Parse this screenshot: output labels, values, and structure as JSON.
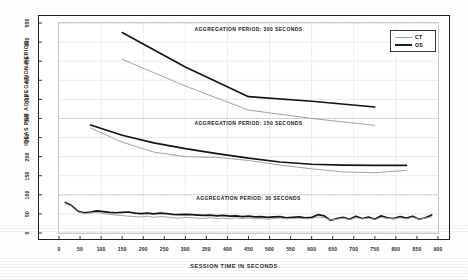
{
  "chart_data": {
    "type": "line",
    "title": "",
    "xlabel": "SESSION TIME IN SECONDS",
    "ylabel": "IDEAS PER AGGREGATION PERIOD",
    "xlim": [
      0,
      900
    ],
    "ylim": [
      0,
      550
    ],
    "xticks": [
      0,
      50,
      100,
      150,
      200,
      250,
      300,
      350,
      400,
      450,
      500,
      550,
      600,
      650,
      700,
      750,
      800,
      850,
      900
    ],
    "yticks": [
      0,
      50,
      100,
      150,
      200,
      250,
      300,
      350,
      400,
      450,
      500,
      550
    ],
    "grid": true,
    "legend_position": "top-right",
    "legend": [
      "CT",
      "OS"
    ],
    "panel_separators": [
      100,
      300
    ],
    "annotations": [
      {
        "text": "AGGREGATION PERIOD: 300 SECONDS",
        "x": 450,
        "y": 535
      },
      {
        "text": "AGGREGATION PERIOD: 150 SECONDS",
        "x": 450,
        "y": 288
      },
      {
        "text": "AGGREGATION PERIOD: 30 SECONDS",
        "x": 450,
        "y": 92
      }
    ],
    "panels": [
      {
        "name": "aggregation-300-seconds",
        "aggregation_period": 300,
        "series": [
          {
            "name": "OS",
            "x": [
              150,
              300,
              450,
              600,
              750
            ],
            "values": [
              525,
              435,
              357,
              345,
              330
            ]
          },
          {
            "name": "CT",
            "x": [
              150,
              300,
              450,
              600,
              750
            ],
            "values": [
              455,
              385,
              322,
              300,
              282
            ]
          }
        ]
      },
      {
        "name": "aggregation-150-seconds",
        "aggregation_period": 150,
        "series": [
          {
            "name": "OS",
            "x": [
              75,
              150,
              225,
              300,
              375,
              450,
              525,
              600,
              675,
              750,
              825
            ],
            "values": [
              283,
              256,
              236,
              221,
              208,
              196,
              186,
              180,
              178,
              177,
              177
            ]
          },
          {
            "name": "CT",
            "x": [
              75,
              150,
              225,
              300,
              375,
              450,
              525,
              600,
              675,
              750,
              825
            ],
            "values": [
              275,
              238,
              212,
              200,
              198,
              190,
              178,
              168,
              160,
              158,
              164
            ]
          }
        ]
      },
      {
        "name": "aggregation-30-seconds",
        "aggregation_period": 30,
        "series": [
          {
            "name": "OS",
            "x": [
              15,
              30,
              45,
              60,
              75,
              90,
              105,
              120,
              135,
              150,
              165,
              180,
              195,
              210,
              225,
              240,
              255,
              270,
              285,
              300,
              315,
              330,
              345,
              360,
              375,
              390,
              405,
              420,
              435,
              450,
              465,
              480,
              495,
              510,
              525,
              540,
              555,
              570,
              585,
              600,
              615,
              630,
              645,
              660,
              675,
              690,
              705,
              720,
              735,
              750,
              765,
              780,
              795,
              810,
              825,
              840,
              855,
              870,
              885
            ],
            "values": [
              80,
              72,
              57,
              53,
              55,
              58,
              56,
              54,
              53,
              54,
              55,
              52,
              51,
              52,
              50,
              52,
              51,
              49,
              48,
              49,
              48,
              47,
              46,
              47,
              45,
              46,
              44,
              45,
              43,
              44,
              42,
              43,
              41,
              42,
              43,
              40,
              41,
              42,
              40,
              41,
              48,
              45,
              33,
              38,
              41,
              36,
              44,
              38,
              42,
              36,
              45,
              40,
              38,
              43,
              39,
              44,
              36,
              40,
              47
            ]
          },
          {
            "name": "CT",
            "x": [
              15,
              30,
              45,
              60,
              75,
              90,
              105,
              120,
              135,
              150,
              165,
              180,
              195,
              210,
              225,
              240,
              255,
              270,
              285,
              300,
              315,
              330,
              345,
              360,
              375,
              390,
              405,
              420,
              435,
              450,
              465,
              480,
              495,
              510,
              525,
              540,
              555,
              570,
              585,
              600,
              615,
              630,
              645,
              660,
              675,
              690,
              705,
              720,
              735,
              750,
              765,
              780,
              795,
              810,
              825,
              840,
              855,
              870,
              885
            ],
            "values": [
              78,
              70,
              55,
              51,
              52,
              54,
              51,
              49,
              47,
              46,
              44,
              43,
              42,
              44,
              41,
              43,
              42,
              40,
              39,
              41,
              40,
              39,
              38,
              40,
              38,
              39,
              37,
              40,
              38,
              39,
              37,
              38,
              36,
              38,
              39,
              37,
              38,
              39,
              37,
              38,
              42,
              40,
              34,
              36,
              39,
              35,
              40,
              37,
              39,
              35,
              41,
              38,
              37,
              40,
              37,
              41,
              36,
              39,
              42
            ]
          }
        ]
      }
    ]
  },
  "axis": {
    "y_label": "IDEAS PER AGGREGATION PERIOD",
    "x_label": "SESSION TIME IN SECONDS"
  },
  "legend": {
    "items": [
      {
        "key": "ct",
        "label": "CT"
      },
      {
        "key": "os",
        "label": "OS"
      }
    ]
  },
  "annotations": {
    "panel_top": "AGGREGATION PERIOD: 300 SECONDS",
    "panel_middle": "AGGREGATION PERIOD: 150 SECONDS",
    "panel_bottom": "AGGREGATION PERIOD: 30 SECONDS"
  }
}
